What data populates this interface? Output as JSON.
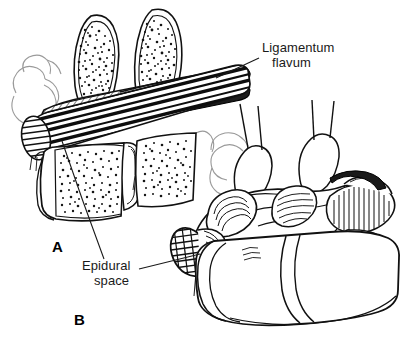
{
  "figure": {
    "background_color": "#ffffff",
    "ink_color": "#000000",
    "faint_ink_color": "#8c8c8c",
    "width": 409,
    "height": 347
  },
  "labels": {
    "ligamentum_flavum": {
      "line1": "Ligamentum",
      "line2": "flavum"
    },
    "epidural_space": {
      "line1": "Epidural",
      "line2": "space"
    }
  },
  "panels": {
    "a": {
      "letter": "A",
      "description": "Midsagittal cut-away view showing spinous processes, ligamentum flavum, dural sac and vertebral bodies"
    },
    "b": {
      "letter": "B",
      "description": "Oblique three-dimensional view of lumbar vertebrae with cut spinal dural sac and exiting nerve roots"
    }
  },
  "leaders": {
    "ligamentum_flavum": "line from label down-left to hatched ligament band",
    "epidural_space_panel_a": "long line from label up-left to dural sac in panel A",
    "epidural_space_panel_b": "line from label right to cut dural sac in panel B"
  }
}
